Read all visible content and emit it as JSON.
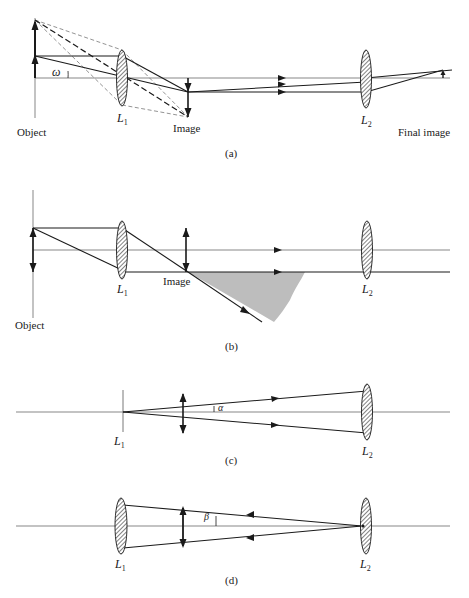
{
  "figure": {
    "colors": {
      "ink": "#1a1a1a",
      "axis": "#555555",
      "dashed": "#777777",
      "shade": "#bdbdbd",
      "background": "#ffffff"
    },
    "panels": [
      {
        "id": "a",
        "caption": "(a)",
        "labels": {
          "object": "Object",
          "lens1": "L",
          "lens1_sub": "1",
          "image": "Image",
          "lens2": "L",
          "lens2_sub": "2",
          "final_image": "Final image",
          "angle": "ω"
        }
      },
      {
        "id": "b",
        "caption": "(b)",
        "labels": {
          "object": "Object",
          "lens1": "L",
          "lens1_sub": "1",
          "image": "Image",
          "lens2": "L",
          "lens2_sub": "2"
        }
      },
      {
        "id": "c",
        "caption": "(c)",
        "labels": {
          "lens1": "L",
          "lens1_sub": "1",
          "lens2": "L",
          "lens2_sub": "2",
          "angle": "α"
        }
      },
      {
        "id": "d",
        "caption": "(d)",
        "labels": {
          "lens1": "L",
          "lens1_sub": "1",
          "lens2": "L",
          "lens2_sub": "2",
          "angle": "β"
        }
      }
    ]
  }
}
